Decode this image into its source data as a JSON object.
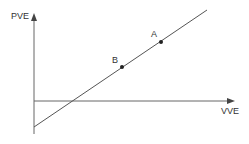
{
  "diagram": {
    "y_axis_label": "PVE",
    "x_axis_label": "VVE",
    "points": [
      {
        "label": "A",
        "x": 161,
        "y": 42
      },
      {
        "label": "B",
        "x": 122,
        "y": 67
      }
    ],
    "line": {
      "x1": 34,
      "y1": 127,
      "x2": 207,
      "y2": 10
    },
    "colors": {
      "line": "#555555",
      "axis": "#666666",
      "point": "#222222",
      "text": "#333333"
    }
  }
}
